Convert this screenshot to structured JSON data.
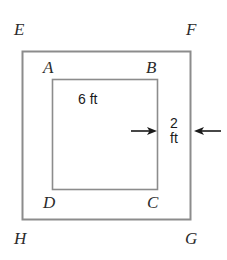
{
  "figure": {
    "type": "geometry-diagram",
    "line_color": "#8c8c8c",
    "arrow_color": "#1a1a1a",
    "text_color": "#2b2b2b",
    "background": "#ffffff"
  },
  "outer_square": {
    "name": "EFGH",
    "vertices": [
      {
        "id": "E",
        "label": "E",
        "corner": "top-left"
      },
      {
        "id": "F",
        "label": "F",
        "corner": "top-right"
      },
      {
        "id": "G",
        "label": "G",
        "corner": "bottom-right"
      },
      {
        "id": "H",
        "label": "H",
        "corner": "bottom-left"
      }
    ],
    "geometry": {
      "x": 22,
      "y": 51,
      "width": 169,
      "height": 169
    }
  },
  "inner_square": {
    "name": "ABCD",
    "vertices": [
      {
        "id": "A",
        "label": "A",
        "corner": "top-left"
      },
      {
        "id": "B",
        "label": "B",
        "corner": "top-right"
      },
      {
        "id": "C",
        "label": "C",
        "corner": "bottom-right"
      },
      {
        "id": "D",
        "label": "D",
        "corner": "bottom-left"
      }
    ],
    "geometry": {
      "x": 52,
      "y": 79,
      "width": 106,
      "height": 111
    }
  },
  "dimensions": [
    {
      "id": "inner-side",
      "label": "6 ft",
      "value": 6,
      "unit": "ft",
      "applies_to": "inner_square side AB"
    },
    {
      "id": "border-width",
      "label_lines": [
        "2",
        "ft"
      ],
      "label": "2 ft",
      "value": 2,
      "unit": "ft",
      "applies_to": "gap between inner square BC and outer square FG"
    }
  ],
  "arrows": [
    {
      "id": "left-arrow",
      "direction": "right",
      "points_to": "inner square right edge"
    },
    {
      "id": "right-arrow",
      "direction": "left",
      "points_to": "outer square right edge"
    }
  ]
}
